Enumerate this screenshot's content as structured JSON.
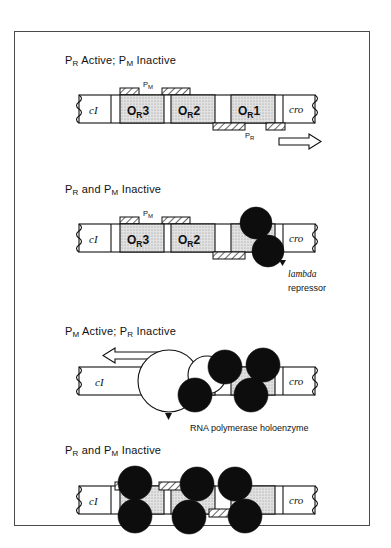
{
  "figure": {
    "caption_absent": true,
    "border_color": "#4a4a4a",
    "background": "#ffffff"
  },
  "legend": {
    "repressor_label_line1": "lambda",
    "repressor_label_line2": "repressor",
    "polymerase_label": "RNA polymerase holoenzyme"
  },
  "dna": {
    "left_gene": "cI",
    "right_gene": "cro",
    "operators": [
      "O",
      "O",
      "O"
    ],
    "operator_subscript": "R",
    "operator_numbers": [
      "3",
      "2",
      "1"
    ],
    "promoter_left": "P",
    "promoter_left_sub": "M",
    "promoter_right": "P",
    "promoter_right_sub": "R"
  },
  "panels": [
    {
      "id": "panel-1",
      "title_parts": [
        "P",
        "R",
        " Active; P",
        "M",
        " Inactive"
      ],
      "title_plain": "PR Active; PM Inactive",
      "operators_shown": [
        "OR3",
        "OR2",
        "OR1"
      ],
      "promoters_shown": [
        "PM",
        "PR"
      ],
      "repressor_count": 0,
      "polymerase_count": 0,
      "transcription_arrow": "right",
      "arrow_direction": "rightward"
    },
    {
      "id": "panel-2",
      "title_parts": [
        "P",
        "R",
        " and P",
        "M",
        " Inactive"
      ],
      "title_plain": "PR and PM Inactive",
      "operators_shown": [
        "OR3",
        "OR2"
      ],
      "promoters_shown": [
        "PM",
        "PR"
      ],
      "repressor_count": 2,
      "polymerase_count": 0,
      "transcription_arrow": "none",
      "occupied_operator": "OR1",
      "callout": "lambda repressor"
    },
    {
      "id": "panel-3",
      "title_parts": [
        "P",
        "M",
        " Active; P",
        "R",
        " Inactive"
      ],
      "title_plain": "PM Active; PR Inactive",
      "operators_shown": [],
      "promoters_shown": [],
      "repressor_count": 4,
      "polymerase_count": 2,
      "transcription_arrow": "left",
      "arrow_direction": "leftward",
      "callout": "RNA polymerase holoenzyme"
    },
    {
      "id": "panel-4",
      "title_parts": [
        "P",
        "R",
        " and P",
        "M",
        " Inactive"
      ],
      "title_plain": "PR and PM Inactive",
      "operators_shown": [],
      "promoters_shown": [],
      "repressor_count": 6,
      "polymerase_count": 0,
      "transcription_arrow": "none"
    }
  ],
  "colors": {
    "operator_fill": "#d8d8d8",
    "repressor_fill": "#0d0d0d",
    "polymerase_fill": "#ffffff",
    "stroke": "#111111"
  }
}
